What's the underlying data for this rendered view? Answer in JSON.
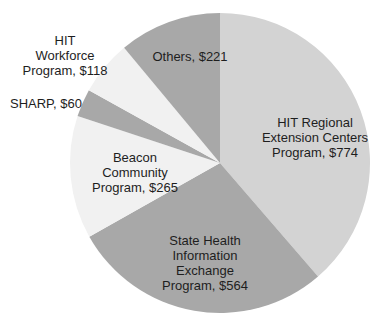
{
  "chart_data": {
    "type": "pie",
    "title": "",
    "start_angle_deg": 0,
    "direction": "clockwise",
    "unit": "$",
    "slices": [
      {
        "label": "HIT Regional Extension Centers Program",
        "value": 774,
        "color": "#d3d3d3",
        "text_lines": [
          "HIT Regional",
          "Extension Centers",
          "Program, $774"
        ]
      },
      {
        "label": "State Health Information Exchange Program",
        "value": 564,
        "color": "#a8a8a8",
        "text_lines": [
          "State Health",
          "Information",
          "Exchange",
          "Program, $564"
        ]
      },
      {
        "label": "Beacon Community Program",
        "value": 265,
        "color": "#f1f1f1",
        "text_lines": [
          "Beacon",
          "Community",
          "Program, $265"
        ]
      },
      {
        "label": "SHARP",
        "value": 60,
        "color": "#a8a8a8",
        "text_lines": [
          "SHARP, $60"
        ]
      },
      {
        "label": "HIT Workforce Program",
        "value": 118,
        "color": "#f1f1f1",
        "text_lines": [
          "HIT",
          "Workforce",
          "Program, $118"
        ]
      },
      {
        "label": "Others",
        "value": 221,
        "color": "#a8a8a8",
        "text_lines": [
          "Others, $221"
        ]
      }
    ],
    "total": 2002,
    "legend": "none"
  }
}
